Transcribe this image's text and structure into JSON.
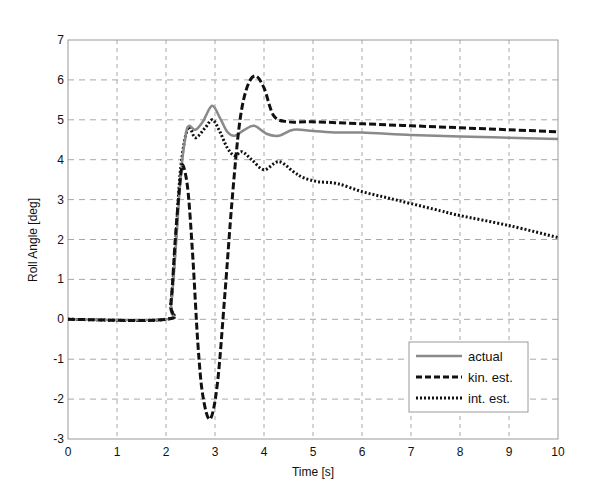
{
  "chart_data": {
    "type": "line",
    "title": "",
    "xlabel": "Time [s]",
    "ylabel": "Roll Angle [deg]",
    "xlim": [
      0,
      10
    ],
    "ylim": [
      -3,
      7
    ],
    "xticks": [
      0,
      1,
      2,
      3,
      4,
      5,
      6,
      7,
      8,
      9,
      10
    ],
    "yticks": [
      -3,
      -2,
      -1,
      0,
      1,
      2,
      3,
      4,
      5,
      6,
      7
    ],
    "grid": true,
    "legend_position": "lower right",
    "series": [
      {
        "name": "actual",
        "style": "solid",
        "color": "#8a8a8a",
        "x": [
          0,
          2.0,
          2.1,
          2.2,
          2.3,
          2.4,
          2.47,
          2.6,
          2.75,
          2.94,
          3.1,
          3.25,
          3.4,
          3.6,
          3.8,
          4.05,
          4.3,
          4.6,
          5.0,
          5.5,
          6.0,
          7.0,
          8.0,
          9.0,
          10.0
        ],
        "y": [
          0,
          0,
          0.3,
          1.8,
          3.6,
          4.6,
          4.85,
          4.75,
          4.95,
          5.35,
          5.05,
          4.7,
          4.6,
          4.75,
          4.85,
          4.65,
          4.6,
          4.75,
          4.72,
          4.68,
          4.68,
          4.62,
          4.58,
          4.55,
          4.52
        ]
      },
      {
        "name": "kin. est.",
        "style": "dashed",
        "color": "#111111",
        "x": [
          0,
          2.0,
          2.1,
          2.2,
          2.3,
          2.35,
          2.45,
          2.55,
          2.65,
          2.75,
          2.9,
          3.05,
          3.2,
          3.35,
          3.5,
          3.65,
          3.82,
          4.0,
          4.2,
          4.5,
          5.0,
          6.0,
          7.0,
          8.0,
          9.0,
          10.0
        ],
        "y": [
          0,
          0,
          0.4,
          2.2,
          3.6,
          3.85,
          3.2,
          1.5,
          -0.6,
          -1.9,
          -2.5,
          -1.6,
          0.6,
          3.0,
          4.9,
          5.8,
          6.1,
          5.8,
          5.1,
          4.95,
          4.95,
          4.9,
          4.85,
          4.8,
          4.75,
          4.7
        ]
      },
      {
        "name": "int. est.",
        "style": "dotted",
        "color": "#111111",
        "x": [
          0,
          2.0,
          2.1,
          2.2,
          2.3,
          2.45,
          2.6,
          2.8,
          2.95,
          3.1,
          3.25,
          3.4,
          3.55,
          3.75,
          4.0,
          4.3,
          4.6,
          4.8,
          5.1,
          5.5,
          6.0,
          6.5,
          7.0,
          7.6,
          8.0,
          9.0,
          10.0
        ],
        "y": [
          0,
          0,
          0.4,
          2.0,
          3.8,
          4.8,
          4.55,
          4.8,
          5.0,
          4.7,
          4.3,
          4.1,
          4.2,
          4.0,
          3.75,
          3.95,
          3.7,
          3.55,
          3.45,
          3.4,
          3.2,
          3.05,
          2.9,
          2.72,
          2.6,
          2.35,
          2.05
        ]
      }
    ]
  },
  "legend": {
    "items": [
      {
        "label": "actual"
      },
      {
        "label": "kin. est."
      },
      {
        "label": "int. est."
      }
    ]
  },
  "axes": {
    "xlabel": "Time [s]",
    "ylabel": "Roll Angle [deg]"
  }
}
